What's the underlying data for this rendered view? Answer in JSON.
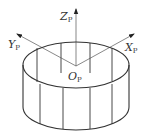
{
  "diagram": {
    "type": "cylindrical-ring-coordinate-frame",
    "colors": {
      "stroke": "#333333",
      "axis": "#555555",
      "background": "#ffffff"
    },
    "axes": [
      {
        "name": "Z",
        "subscript": "P",
        "label": "Z_P",
        "direction": "up"
      },
      {
        "name": "Y",
        "subscript": "P",
        "label": "Y_P",
        "direction": "upper-left"
      },
      {
        "name": "X",
        "subscript": "P",
        "label": "X_P",
        "direction": "upper-right"
      }
    ],
    "origin": {
      "name": "O",
      "subscript": "P",
      "label": "O_P"
    },
    "labels": {
      "z_main": "Z",
      "z_sub": "P",
      "y_main": "Y",
      "y_sub": "P",
      "x_main": "X",
      "x_sub": "P",
      "o_main": "O",
      "o_sub": "P"
    },
    "shape": {
      "kind": "ring-cylinder",
      "front_vertical_lines": 4,
      "back_vertical_lines": 4
    }
  }
}
